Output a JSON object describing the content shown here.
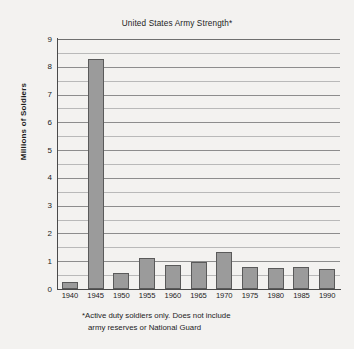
{
  "chart_data": {
    "type": "bar",
    "title": "United States Army Strength*",
    "xlabel": "",
    "ylabel": "Millions of Soldiers",
    "categories": [
      "1940",
      "1945",
      "1950",
      "1955",
      "1960",
      "1965",
      "1970",
      "1975",
      "1980",
      "1985",
      "1990"
    ],
    "values": [
      0.27,
      8.27,
      0.59,
      1.11,
      0.87,
      0.97,
      1.32,
      0.78,
      0.76,
      0.78,
      0.73
    ],
    "ylim": [
      0,
      9
    ],
    "ytick_labels": [
      "0",
      "1",
      "2",
      "3",
      "4",
      "5",
      "6",
      "7",
      "8",
      "9"
    ],
    "ytick_values": [
      0,
      1,
      2,
      3,
      4,
      5,
      6,
      7,
      8,
      9
    ],
    "gridline_interval": 0.5,
    "grid": true,
    "legend": "none",
    "bar_color": "#9b9b9b",
    "bar_edge_color": "#5a5a5a",
    "background_color": "#f3f2f0",
    "annotations": {
      "footnote_line1": "*Active duty soldiers only. Does not include",
      "footnote_line2": "army reserves or National Guard"
    }
  }
}
